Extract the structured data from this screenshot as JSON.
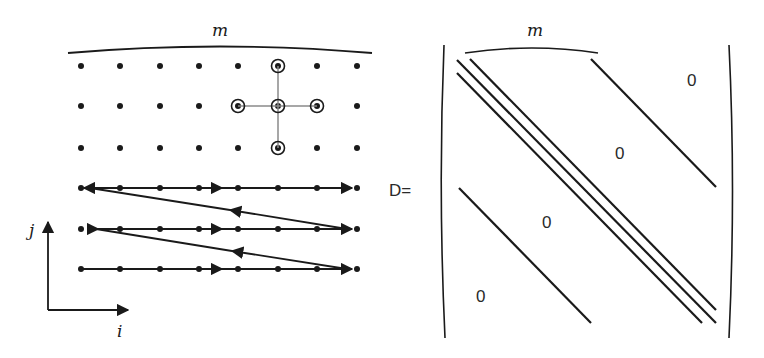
{
  "left_panel": {
    "width_label": "m",
    "axis_i_label": "i",
    "axis_j_label": "j",
    "grid": {
      "columns_x": [
        81,
        120,
        160,
        199,
        238,
        278,
        317,
        357
      ],
      "top_rows_y": [
        66,
        106,
        148
      ],
      "bottom_rows_y": [
        188,
        229,
        269
      ]
    },
    "stencil": {
      "center": [
        278,
        106
      ],
      "neighbors": [
        [
          278,
          66
        ],
        [
          238,
          106
        ],
        [
          317,
          106
        ],
        [
          278,
          148
        ]
      ]
    }
  },
  "right_panel": {
    "matrix_name": "D=",
    "width_label": "m",
    "zero_labels": [
      {
        "text": "0",
        "x": 693,
        "y": 86
      },
      {
        "text": "0",
        "x": 621,
        "y": 159
      },
      {
        "text": "0",
        "x": 548,
        "y": 228
      },
      {
        "text": "0",
        "x": 482,
        "y": 302
      }
    ]
  },
  "colors": {
    "ink": "#1a1a1a",
    "stencil_line": "#8a8a8a",
    "background": "#ffffff"
  }
}
